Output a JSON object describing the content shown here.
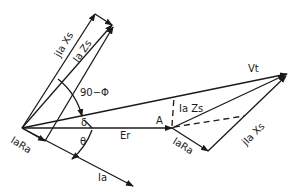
{
  "diagram": {
    "colors": {
      "stroke": "#1a1a1a",
      "background": "#ffffff"
    },
    "labels": {
      "vt": "Vt",
      "er": "Er",
      "ia": "Ia",
      "a_point": "A",
      "ia_zs_right": "Ia Zs",
      "jia_xs_right": "jIa Xs",
      "iara_right": "IaRa",
      "iara_left": "IaRa",
      "jia_xs_left": "jIa Xs",
      "ia_zs_left": "Ia Zs",
      "angle_90_phi": "90−Φ",
      "delta": "δ",
      "theta": "θ"
    }
  }
}
